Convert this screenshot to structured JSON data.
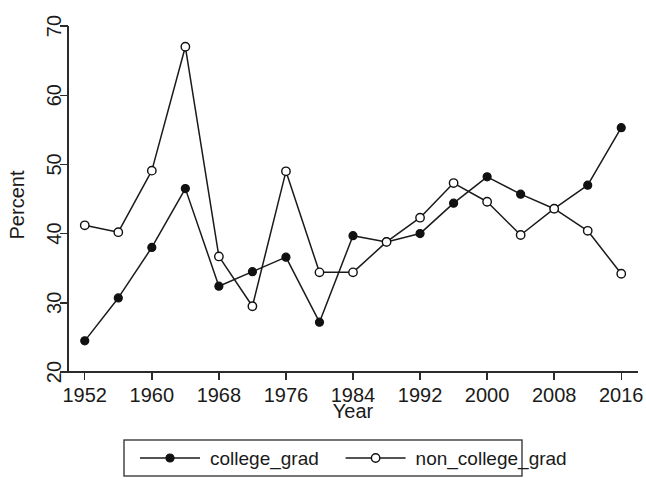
{
  "chart_data": {
    "type": "line",
    "title": "",
    "xlabel": "Year",
    "ylabel": "Percent",
    "xlim": [
      1950,
      2018
    ],
    "ylim": [
      20,
      70
    ],
    "grid": false,
    "legend_position": "bottom",
    "x": [
      1952,
      1956,
      1960,
      1964,
      1968,
      1972,
      1976,
      1980,
      1984,
      1988,
      1992,
      1996,
      2000,
      2004,
      2008,
      2012,
      2016
    ],
    "xticks": [
      "1952",
      "1960",
      "1968",
      "1976",
      "1984",
      "1992",
      "2000",
      "2008",
      "2016"
    ],
    "xtick_values": [
      1952,
      1960,
      1968,
      1976,
      1984,
      1992,
      2000,
      2008,
      2016
    ],
    "yticks": [
      "20",
      "30",
      "40",
      "50",
      "60",
      "70"
    ],
    "ytick_values": [
      20,
      30,
      40,
      50,
      60,
      70
    ],
    "series": [
      {
        "name": "college_grad",
        "marker": "filled-circle",
        "values": [
          24.5,
          30.7,
          38.0,
          46.5,
          32.4,
          34.5,
          36.6,
          27.2,
          39.7,
          38.8,
          40.0,
          44.4,
          48.2,
          45.7,
          43.6,
          47.0,
          55.3
        ]
      },
      {
        "name": "non_college_grad",
        "marker": "open-circle",
        "values": [
          41.2,
          40.2,
          49.1,
          67.0,
          36.7,
          29.5,
          49.0,
          34.4,
          34.4,
          38.8,
          42.3,
          47.3,
          44.6,
          39.8,
          43.6,
          40.4,
          34.2
        ]
      }
    ],
    "legend": [
      {
        "label": "college_grad",
        "marker": "filled-circle"
      },
      {
        "label": "non_college_grad",
        "marker": "open-circle"
      }
    ],
    "colors": {
      "line": "#1a1a1a",
      "axis": "#2b2b2b",
      "background": "#ffffff"
    }
  }
}
